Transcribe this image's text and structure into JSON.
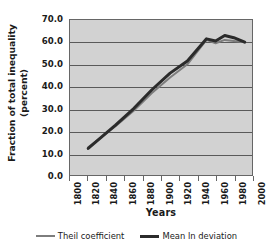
{
  "chart_data": {
    "type": "line",
    "title": "",
    "xlabel": "Years",
    "ylabel": "Fraction of total inequality (percent)",
    "ylabel_line1": "Fraction of total inequality",
    "ylabel_line2": "(percent)",
    "xlim": [
      1800,
      2000
    ],
    "ylim": [
      0.0,
      70.0
    ],
    "grid": "horizontal",
    "legend_position": "bottom",
    "yticks": [
      "0.0",
      "10.0",
      "20.0",
      "30.0",
      "40.0",
      "50.0",
      "60.0",
      "70.0"
    ],
    "ytick_values": [
      0.0,
      10.0,
      20.0,
      30.0,
      40.0,
      50.0,
      60.0,
      70.0
    ],
    "xticks": [
      "1800",
      "1820",
      "1840",
      "1860",
      "1880",
      "1900",
      "1920",
      "1940",
      "1960",
      "1980",
      "2000"
    ],
    "xtick_values": [
      1800,
      1820,
      1840,
      1860,
      1880,
      1900,
      1920,
      1940,
      1960,
      1980,
      2000
    ],
    "x": [
      1820,
      1850,
      1870,
      1890,
      1910,
      1929,
      1950,
      1960,
      1970,
      1980,
      1992
    ],
    "series": [
      {
        "name": "Theil coefficient",
        "color": "#7d7d7d",
        "width": 2,
        "values": [
          12.5,
          22.0,
          29.0,
          37.0,
          44.0,
          50.0,
          61.0,
          59.5,
          61.0,
          60.5,
          60.0
        ]
      },
      {
        "name": "Mean ln deviation",
        "color": "#2b2b2b",
        "width": 3,
        "values": [
          12.0,
          22.5,
          30.0,
          38.5,
          46.0,
          51.5,
          61.5,
          60.5,
          63.0,
          62.0,
          60.0
        ]
      }
    ]
  },
  "legend": {
    "items": [
      {
        "label": "Theil coefficient"
      },
      {
        "label": "Mean ln deviation"
      }
    ]
  },
  "colors": {
    "plot_background": "#d2d2d2",
    "plot_border": "#666666",
    "gridline": "#5a5a5a",
    "series_theil": "#7d7d7d",
    "series_mld": "#2b2b2b",
    "text": "#1a1a1a",
    "page_background": "#ffffff"
  }
}
